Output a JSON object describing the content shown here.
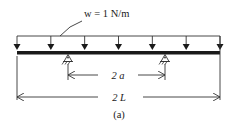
{
  "diagram": {
    "load_label": "w = 1 N/m",
    "inner_span_label": "2 a",
    "total_span_label": "2 L",
    "caption": "(a)",
    "load_arrow_count": 7,
    "support_count": 2
  }
}
